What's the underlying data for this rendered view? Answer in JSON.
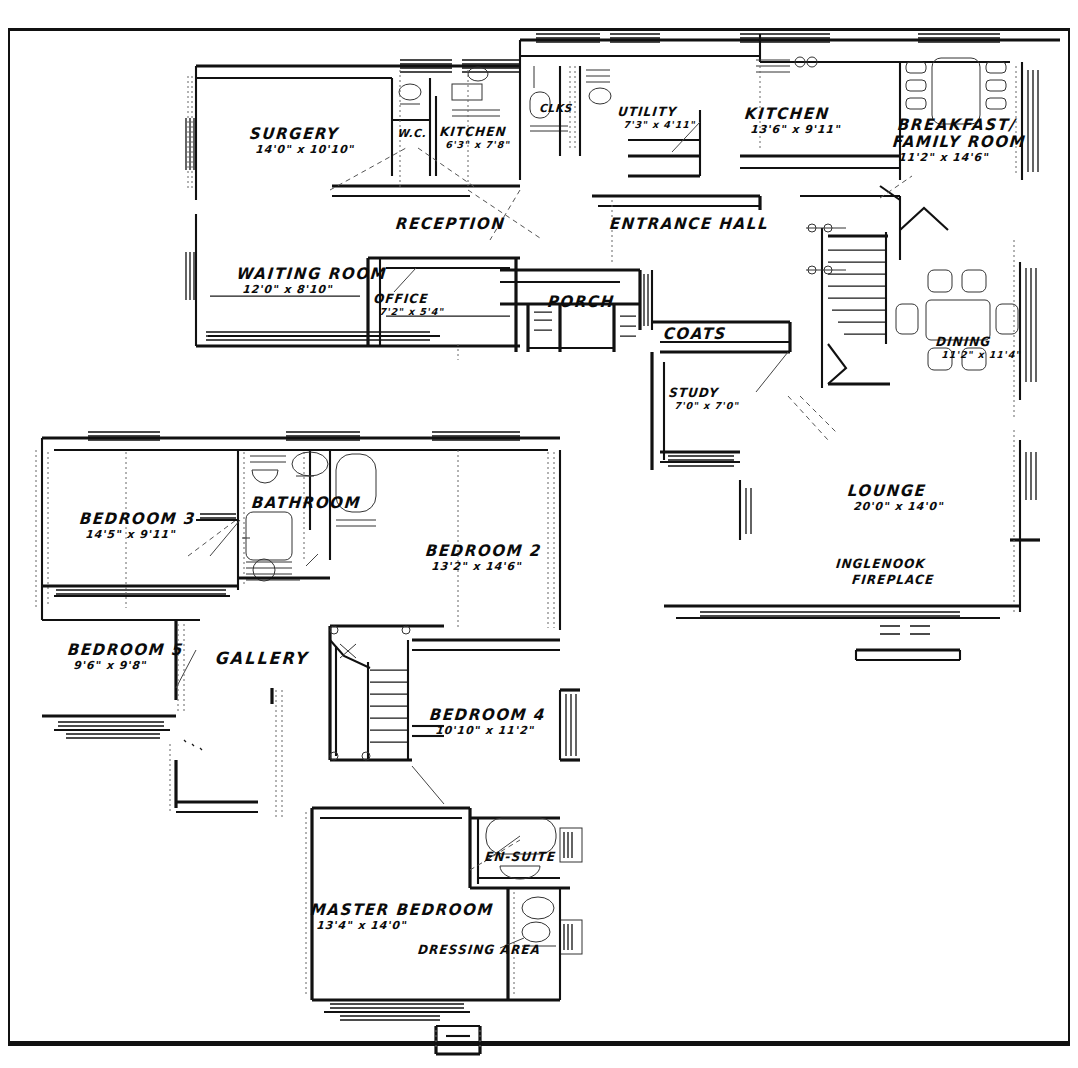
{
  "document": {
    "type": "architectural-floor-plan",
    "title": "House Floor Plan",
    "sheet_width": 1078,
    "sheet_height": 1068,
    "ink_color": "#0b0b0b",
    "paper_color": "#ffffff",
    "border_color": "#111111"
  },
  "ground_floor": {
    "name": "Ground Floor",
    "rooms": [
      {
        "id": "surgery",
        "name": "SURGERY",
        "dims": "14'0\" x 10'10\"",
        "x": 250,
        "y": 126,
        "size": "normal"
      },
      {
        "id": "wc",
        "name": "W.C.",
        "dims": "",
        "x": 398,
        "y": 128,
        "size": "tiny"
      },
      {
        "id": "kitchen-surgery",
        "name": "KITCHEN",
        "dims": "6'3\" x 7'8\"",
        "x": 440,
        "y": 126,
        "size": "small"
      },
      {
        "id": "clks",
        "name": "CLKS",
        "dims": "",
        "x": 540,
        "y": 103,
        "size": "tiny"
      },
      {
        "id": "utility",
        "name": "UTILITY",
        "dims": "7'3\" x 4'11\"",
        "x": 618,
        "y": 106,
        "size": "small"
      },
      {
        "id": "kitchen-main",
        "name": "KITCHEN",
        "dims": "13'6\" x 9'11\"",
        "x": 745,
        "y": 106,
        "size": "normal"
      },
      {
        "id": "breakfast-family",
        "name": "BREAKFAST/",
        "dims": "",
        "x": 898,
        "y": 117,
        "size": "normal"
      },
      {
        "id": "family-room",
        "name": "FAMILY ROOM",
        "dims": "11'2\" x 14'6\"",
        "x": 893,
        "y": 134,
        "size": "normal"
      },
      {
        "id": "reception",
        "name": "RECEPTION",
        "dims": "",
        "x": 396,
        "y": 216,
        "size": "normal"
      },
      {
        "id": "entrance-hall",
        "name": "ENTRANCE HALL",
        "dims": "",
        "x": 610,
        "y": 216,
        "size": "normal"
      },
      {
        "id": "waiting-room",
        "name": "WAITING ROOM",
        "dims": "12'0\" x 8'10\"",
        "x": 237,
        "y": 266,
        "size": "normal"
      },
      {
        "id": "office",
        "name": "OFFICE",
        "dims": "7'2\" x 5'4\"",
        "x": 374,
        "y": 293,
        "size": "small"
      },
      {
        "id": "porch",
        "name": "PORCH",
        "dims": "",
        "x": 548,
        "y": 294,
        "size": "normal"
      },
      {
        "id": "coats",
        "name": "COATS",
        "dims": "",
        "x": 664,
        "y": 326,
        "size": "normal"
      },
      {
        "id": "study",
        "name": "STUDY",
        "dims": "7'0\" x 7'0\"",
        "x": 669,
        "y": 387,
        "size": "small"
      },
      {
        "id": "dining",
        "name": "DINING",
        "dims": "11'2\" x 11'4\"",
        "x": 936,
        "y": 336,
        "size": "small"
      },
      {
        "id": "lounge",
        "name": "LOUNGE",
        "dims": "20'0\" x 14'0\"",
        "x": 848,
        "y": 483,
        "size": "normal"
      },
      {
        "id": "inglenook",
        "name": "INGLENOOK",
        "dims": "",
        "x": 836,
        "y": 558,
        "size": "small"
      },
      {
        "id": "fireplace",
        "name": "FIREPLACE",
        "dims": "",
        "x": 852,
        "y": 574,
        "size": "small"
      }
    ]
  },
  "first_floor": {
    "name": "First Floor",
    "rooms": [
      {
        "id": "bedroom-3",
        "name": "BEDROOM 3",
        "dims": "14'5\" x 9'11\"",
        "x": 80,
        "y": 511,
        "size": "normal"
      },
      {
        "id": "bathroom",
        "name": "BATHROOM",
        "dims": "",
        "x": 252,
        "y": 495,
        "size": "normal"
      },
      {
        "id": "bedroom-2",
        "name": "BEDROOM 2",
        "dims": "13'2\" x 14'6\"",
        "x": 426,
        "y": 543,
        "size": "normal"
      },
      {
        "id": "bedroom-5",
        "name": "BEDROOM 5",
        "dims": "9'6\" x 9'8\"",
        "x": 68,
        "y": 642,
        "size": "normal"
      },
      {
        "id": "gallery",
        "name": "GALLERY",
        "dims": "",
        "x": 216,
        "y": 650,
        "size": "normal"
      },
      {
        "id": "bedroom-4",
        "name": "BEDROOM 4",
        "dims": "10'10\" x 11'2\"",
        "x": 430,
        "y": 707,
        "size": "normal"
      },
      {
        "id": "en-suite",
        "name": "EN-SUITE",
        "dims": "",
        "x": 485,
        "y": 851,
        "size": "small"
      },
      {
        "id": "master-bedroom",
        "name": "MASTER BEDROOM",
        "dims": "13'4\" x 14'0\"",
        "x": 311,
        "y": 902,
        "size": "normal"
      },
      {
        "id": "dressing-area",
        "name": "DRESSING AREA",
        "dims": "",
        "x": 418,
        "y": 944,
        "size": "small"
      }
    ]
  }
}
